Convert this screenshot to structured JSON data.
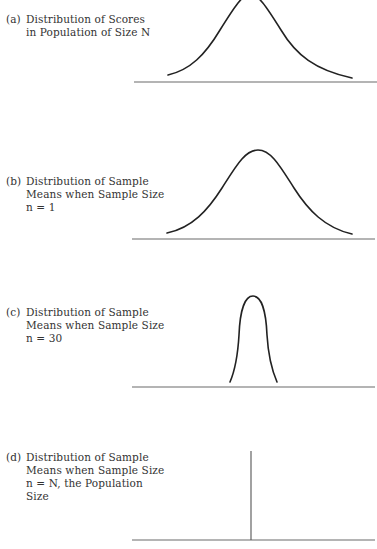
{
  "figure": {
    "panels": [
      {
        "tag": "(a)",
        "label": "Distribution of Scores\nin Population of Size N",
        "shape": "wide normal curve"
      },
      {
        "tag": "(b)",
        "label": "Distribution of Sample\nMeans when Sample Size\nn = 1",
        "shape": "wide normal curve"
      },
      {
        "tag": "(c)",
        "label": "Distribution of Sample\nMeans when Sample Size\nn = 30",
        "shape": "narrow normal curve"
      },
      {
        "tag": "(d)",
        "label": "Distribution of Sample\nMeans when Sample Size\nn = N, the Population\nSize",
        "shape": "single vertical line (zero variance)"
      }
    ],
    "colors": {
      "curve": "#222222",
      "baseline": "#6a6a6a",
      "text": "#333333"
    }
  }
}
